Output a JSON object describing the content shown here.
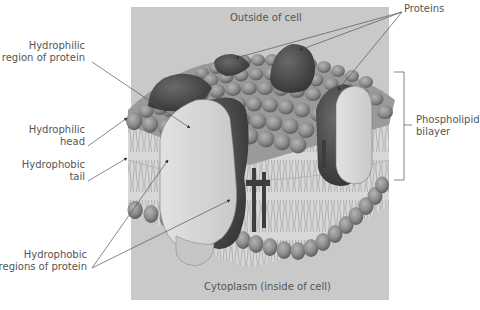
{
  "diagram": {
    "regions": {
      "top": "Outside of cell",
      "bottom": "Cytoplasm (inside of cell)"
    },
    "labels": {
      "hydrophilic_region": {
        "line1": "Hydrophilic",
        "line2": "region of protein"
      },
      "hydrophilic_head": {
        "line1": "Hydrophilic",
        "line2": "head"
      },
      "hydrophobic_tail": {
        "line1": "Hydrophobic",
        "line2": "tail"
      },
      "hydrophobic_regions": {
        "line1": "Hydrophobic",
        "line2": "regions of protein"
      },
      "proteins": "Proteins",
      "bilayer": {
        "line1": "Phospholipid",
        "line2": "bilayer"
      }
    },
    "colors": {
      "panel": "#c9c9c9",
      "protein_dark": "#4a4a4a",
      "protein_light": "#d4d4d4",
      "lipid_head": "#8e8e8e",
      "tail_line": "#9a9a9a",
      "text": "#555555",
      "leader": "#6a6a6a"
    }
  }
}
